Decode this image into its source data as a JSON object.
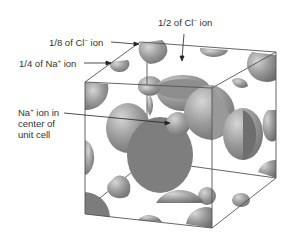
{
  "figure": {
    "labels": {
      "half_cl": {
        "prefix": "1/2 of Cl",
        "charge": "−",
        "suffix": " ion"
      },
      "eighth_cl": {
        "prefix": "1/8 of Cl",
        "charge": "−",
        "suffix": " ion"
      },
      "quarter_na": {
        "prefix": "1/4 of Na",
        "charge": "+",
        "suffix": " ion"
      },
      "center_na": {
        "line1_prefix": "Na",
        "charge": "+",
        "line1_suffix": " ion in",
        "line2": "center of",
        "line3": "unit cell"
      }
    },
    "colors": {
      "ion_dark": "#7a7a7a",
      "ion_mid": "#9a9a9a",
      "ion_light": "#c4c4c4",
      "edge": "#555555",
      "text": "#333333"
    }
  }
}
